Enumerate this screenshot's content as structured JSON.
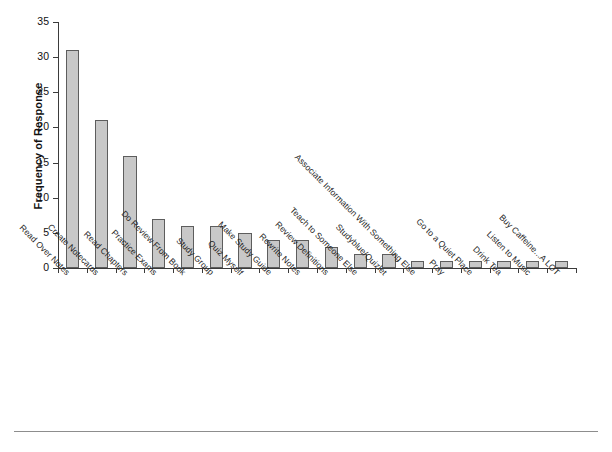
{
  "chart_data": {
    "type": "bar",
    "title": "",
    "subtitle": "",
    "xlabel": "",
    "ylabel": "Frequency of Response",
    "ylim": [
      0,
      35
    ],
    "ytick_labels": [
      "0",
      "5",
      "10",
      "15",
      "20",
      "25",
      "30",
      "35"
    ],
    "ytick_values": [
      0,
      5,
      10,
      15,
      20,
      25,
      30,
      35
    ],
    "grid": false,
    "legend": false,
    "legend_position": "none",
    "bar_fill_color": "#c8c8c8",
    "bar_edge_color": "#5d5d5d",
    "axis_color": "#3b3b3b",
    "background_color": "#ffffff",
    "categories": [
      "Read Over Notes",
      "Create Notecards",
      "Read Chapters",
      "Practice Exams",
      "Do Review From Book",
      "Study Group",
      "Quiz Myself",
      "Make Study Guide",
      "Rewrite Notes",
      "Review Definitions",
      "Teach to Someone Else",
      "Studyblue/Quizlet",
      "Associate Information With Something Else",
      "Pray",
      "Go to a Quiet Place",
      "Drink Tea",
      "Listen to Music",
      "Buy Caffeine...A LOT"
    ],
    "values": [
      31,
      21,
      16,
      7,
      6,
      6,
      5,
      4,
      4,
      3,
      2,
      2,
      1,
      1,
      1,
      1,
      1,
      1
    ]
  }
}
